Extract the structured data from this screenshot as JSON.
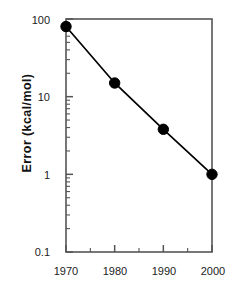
{
  "chart_data": {
    "type": "line",
    "title": "",
    "subtitle": "",
    "xlabel": "",
    "ylabel": "Error  (kcal/mol)",
    "x": [
      1970,
      1980,
      1990,
      2000
    ],
    "values": [
      80,
      15,
      3.8,
      1.0
    ],
    "series": [
      {
        "name": "Error",
        "x": [
          1970,
          1980,
          1990,
          2000
        ],
        "values": [
          80,
          15,
          3.8,
          1.0
        ]
      }
    ],
    "xlim": [
      1970,
      2000
    ],
    "ylim": [
      0.1,
      100
    ],
    "yscale": "log",
    "xscale": "linear",
    "grid": false,
    "legend": false,
    "legend_position": "none",
    "marker": "filled-circle",
    "marker_color": "#000000",
    "line_color": "#000000",
    "frame_color": "#555555",
    "background": "#ffffff",
    "y_ticks_major": [
      0.1,
      1,
      10,
      100
    ],
    "y_tick_labels": [
      "0.1",
      "1",
      "10",
      "100"
    ],
    "y_ticks_minor": [
      0.2,
      0.3,
      0.4,
      0.5,
      0.6,
      0.7,
      0.8,
      0.9,
      2,
      3,
      4,
      5,
      6,
      7,
      8,
      9,
      20,
      30,
      40,
      50,
      60,
      70,
      80,
      90
    ],
    "x_ticks_major": [
      1970,
      1980,
      1990,
      2000
    ],
    "x_tick_labels": [
      "1970",
      "1980",
      "1990",
      "2000"
    ],
    "x_ticks_minor": [
      1975,
      1985,
      1995
    ],
    "annotations": []
  },
  "axes": {
    "y": {
      "label": "Error  (kcal/mol)",
      "ticks": [
        {
          "value": "100"
        },
        {
          "value": "10"
        },
        {
          "value": "1"
        },
        {
          "value": "0.1"
        }
      ]
    },
    "x": {
      "label": "",
      "ticks": [
        {
          "value": "1970"
        },
        {
          "value": "1980"
        },
        {
          "value": "1990"
        },
        {
          "value": "2000"
        }
      ]
    }
  }
}
